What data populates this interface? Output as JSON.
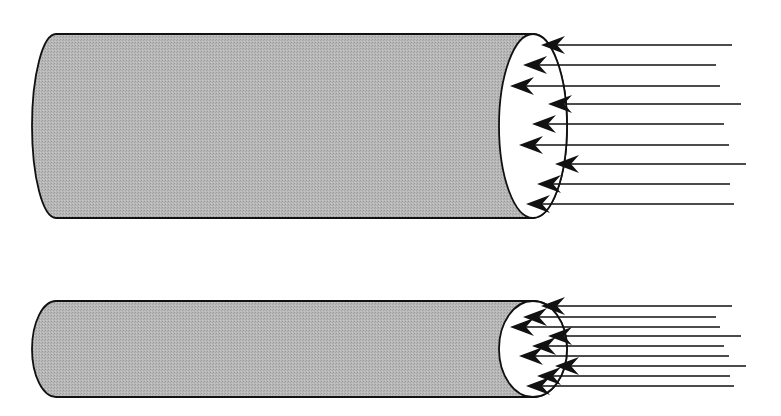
{
  "figure": {
    "description": "Two cylinders with parallel flux lines entering their right end faces",
    "colors": {
      "cylinder_fill": "#b4b4b4",
      "cylinder_stroke": "#111111",
      "end_face_fill": "#ffffff",
      "line_color": "#111111",
      "background": "#ffffff"
    }
  },
  "cylinders": [
    {
      "id": "large",
      "label": "wide cylinder",
      "top_y": 34,
      "bottom_y": 218,
      "left_x": 32,
      "face_cx": 533,
      "face_rx": 34,
      "arrow_count": 9
    },
    {
      "id": "small",
      "label": "narrow cylinder",
      "top_y": 301,
      "bottom_y": 397,
      "left_x": 32,
      "face_cx": 533,
      "face_rx": 34,
      "arrow_count": 9
    }
  ],
  "arrows_top": [
    {
      "y": 45,
      "x_end": 732,
      "tip_x": 541
    },
    {
      "y": 65,
      "x_end": 716,
      "tip_x": 523
    },
    {
      "y": 86,
      "x_end": 720,
      "tip_x": 510
    },
    {
      "y": 104,
      "x_end": 741,
      "tip_x": 548
    },
    {
      "y": 124,
      "x_end": 724,
      "tip_x": 532
    },
    {
      "y": 145,
      "x_end": 729,
      "tip_x": 519
    },
    {
      "y": 164,
      "x_end": 746,
      "tip_x": 555
    },
    {
      "y": 184,
      "x_end": 730,
      "tip_x": 537
    },
    {
      "y": 204,
      "x_end": 734,
      "tip_x": 526
    }
  ],
  "arrows_bottom": [
    {
      "y": 306,
      "x_end": 732,
      "tip_x": 541
    },
    {
      "y": 317,
      "x_end": 716,
      "tip_x": 523
    },
    {
      "y": 327,
      "x_end": 720,
      "tip_x": 510
    },
    {
      "y": 336,
      "x_end": 741,
      "tip_x": 548
    },
    {
      "y": 346,
      "x_end": 724,
      "tip_x": 532
    },
    {
      "y": 356,
      "x_end": 729,
      "tip_x": 519
    },
    {
      "y": 366,
      "x_end": 746,
      "tip_x": 555
    },
    {
      "y": 376,
      "x_end": 730,
      "tip_x": 537
    },
    {
      "y": 386,
      "x_end": 734,
      "tip_x": 526
    }
  ]
}
